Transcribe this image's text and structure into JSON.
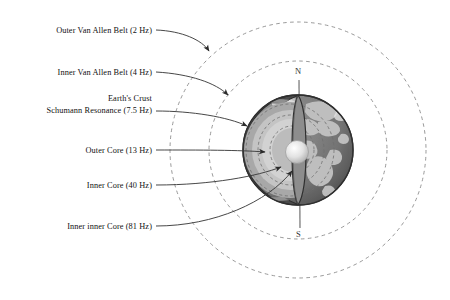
{
  "diagram": {
    "labels": [
      {
        "id": "outer-van-allen-belt",
        "text": "Outer Van Allen Belt (2 Hz)",
        "frequency_hz": 2,
        "x": 152,
        "y": 31
      },
      {
        "id": "inner-van-allen-belt",
        "text": "Inner Van Allen Belt (4 Hz)",
        "frequency_hz": 4,
        "x": 152,
        "y": 73
      },
      {
        "id": "earths-crust",
        "text": "Earth's Crust",
        "x": 152,
        "y": 99
      },
      {
        "id": "schumann-resonance",
        "text": "Schumann Resonance (7.5 Hz)",
        "frequency_hz": 7.5,
        "x": 152,
        "y": 111
      },
      {
        "id": "outer-core",
        "text": "Outer Core (13 Hz)",
        "frequency_hz": 13,
        "x": 152,
        "y": 151
      },
      {
        "id": "inner-core",
        "text": "Inner Core (40 Hz)",
        "frequency_hz": 40,
        "x": 152,
        "y": 186
      },
      {
        "id": "inner-inner-core",
        "text": "Inner inner Core (81 Hz)",
        "frequency_hz": 81,
        "x": 152,
        "y": 227
      }
    ],
    "poles": {
      "north_label": "N",
      "south_label": "S",
      "north_x": 299,
      "north_y": 73,
      "south_x": 300,
      "south_y": 235
    },
    "belts": [
      {
        "name": "outer-van-allen-belt",
        "cx": 298,
        "cy": 150,
        "r": 128,
        "style": "dashed"
      },
      {
        "name": "inner-van-allen-belt",
        "cx": 298,
        "cy": 150,
        "r": 89,
        "style": "dashed"
      }
    ],
    "earth": {
      "cx": 298,
      "cy": 150,
      "r": 55,
      "layers": [
        "crust",
        "mantle",
        "outer-core",
        "inner-core",
        "inner-inner-core"
      ]
    },
    "colors": {
      "ink": "#1a1a1a",
      "leader": "#3a3a3a",
      "belt_dash": "#8a8a8a",
      "ocean": "#6e6e6e",
      "land": "#bdbdbd",
      "crust": "#5a5a5a",
      "mantle": "#9a9a9a",
      "outer_core": "#c9c9c9",
      "inner_core": "#b4b4b4",
      "core_sphere": "#e6e6e6",
      "background": "#ffffff"
    }
  }
}
